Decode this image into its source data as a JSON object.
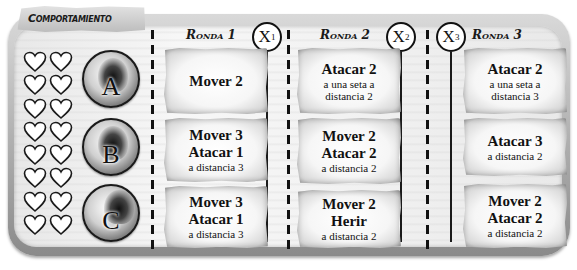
{
  "card": {
    "title": "Comportamiento",
    "health": {
      "hearts_total": 16,
      "columns": 2,
      "rows": 8
    },
    "enemies": [
      {
        "letter": "A",
        "icon": "creature-portrait-a"
      },
      {
        "letter": "B",
        "icon": "creature-portrait-b"
      },
      {
        "letter": "C",
        "icon": "creature-portrait-c"
      }
    ],
    "markers": [
      {
        "label": "X",
        "index": "1"
      },
      {
        "label": "X",
        "index": "2"
      },
      {
        "label": "X",
        "index": "3"
      }
    ],
    "rounds": [
      {
        "title": "Ronda 1",
        "actions": [
          {
            "lines": [
              "Mover 2"
            ],
            "detail": ""
          },
          {
            "lines": [
              "Mover 3",
              "Atacar 1"
            ],
            "detail": "a distancia 3"
          },
          {
            "lines": [
              "Mover 3",
              "Atacar 1"
            ],
            "detail": "a distancia 3"
          }
        ]
      },
      {
        "title": "Ronda 2",
        "actions": [
          {
            "lines": [
              "Atacar 2"
            ],
            "detail": "a una seta a distancia 2"
          },
          {
            "lines": [
              "Mover 2",
              "Atacar 2"
            ],
            "detail": "a distancia 2"
          },
          {
            "lines": [
              "Mover 2",
              "Herir"
            ],
            "detail": "a distancia 2"
          }
        ]
      },
      {
        "title": "Ronda 3",
        "actions": [
          {
            "lines": [
              "Atacar 2"
            ],
            "detail": "a una seta a distancia 3"
          },
          {
            "lines": [
              "Atacar 3"
            ],
            "detail": "a distancia 2"
          },
          {
            "lines": [
              "Mover 2",
              "Atacar 2"
            ],
            "detail": "a distancia 2"
          }
        ]
      }
    ],
    "detail_lines": {
      "r2a1": [
        "a una seta a",
        "distancia 2"
      ],
      "r3a1": [
        "a una seta a",
        "distancia 3"
      ]
    },
    "colors": {
      "ink": "#111111",
      "frame": "#8a8a8a",
      "panel": "#f2f2f2"
    }
  }
}
